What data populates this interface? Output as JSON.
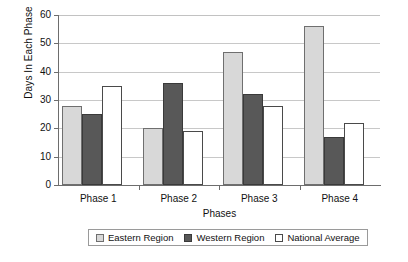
{
  "chart_data": {
    "type": "bar",
    "title": "",
    "xlabel": "Phases",
    "ylabel": "Days In Each Phase",
    "categories": [
      "Phase 1",
      "Phase 2",
      "Phase 3",
      "Phase 4"
    ],
    "series": [
      {
        "name": "Eastern Region",
        "values": [
          28,
          20,
          47,
          56
        ],
        "color": "#d8d8d8"
      },
      {
        "name": "Western Region",
        "values": [
          25,
          36,
          32,
          17
        ],
        "color": "#585858"
      },
      {
        "name": "National Average",
        "values": [
          35,
          19,
          28,
          22
        ],
        "color": "#ffffff"
      }
    ],
    "ylim": [
      0,
      60
    ],
    "yticks": [
      0,
      10,
      20,
      30,
      40,
      50,
      60
    ],
    "ytick_labels": [
      "0",
      "10",
      "20",
      "30",
      "40",
      "50",
      "60"
    ],
    "grid": true,
    "grid_axis": "y",
    "legend_position": "bottom",
    "background_color": "#ffffff",
    "axis_color": "#6d6d6d",
    "gridline_color": "#c8c8c8"
  }
}
